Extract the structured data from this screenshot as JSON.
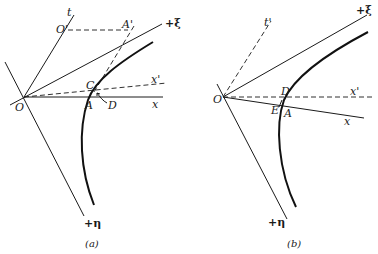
{
  "figure": {
    "panels": [
      {
        "id": "a",
        "caption": "(a)",
        "labels": {
          "t": "t",
          "O_prime": "O'",
          "A_prime": "A'",
          "xi": "+ξ",
          "x": "x",
          "x_prime": "x'",
          "O": "O",
          "A": "A",
          "C": "C",
          "D": "D",
          "eta": "+η"
        }
      },
      {
        "id": "b",
        "caption": "(b)",
        "labels": {
          "t_prime": "t'",
          "xi": "+ξ",
          "x": "x",
          "x_prime": "x'",
          "O": "O",
          "A": "A",
          "D": "D",
          "E": "E",
          "eta": "+η"
        }
      }
    ]
  }
}
